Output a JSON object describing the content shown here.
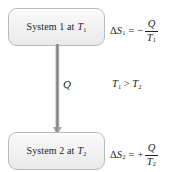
{
  "figure": {
    "type": "thermodynamics-heat-transfer-diagram",
    "background_color": "#ffffff",
    "text_color": "#231f20"
  },
  "top_box": {
    "name": "System 1",
    "prefix": "System 1 at ",
    "temperature_symbol": "T",
    "temperature_subscript": "1",
    "fill_color": "#f1f1f2",
    "border_color": "#b9babc"
  },
  "bottom_box": {
    "name": "System 2",
    "prefix": "System 2 at ",
    "temperature_symbol": "T",
    "temperature_subscript": "2",
    "fill_color": "#f1f1f2",
    "border_color": "#b9babc"
  },
  "arrow": {
    "label": "Q",
    "direction": "down",
    "meaning": "heat flow from system 1 to system 2",
    "color": "#8c8d8f"
  },
  "temperature_comparison": {
    "left_symbol": "T",
    "left_subscript": "1",
    "relation": ">",
    "right_symbol": "T",
    "right_subscript": "2"
  },
  "equations": [
    {
      "id": "entropy-change-system-1",
      "delta": "Δ",
      "quantity": "S",
      "quantity_subscript": "1",
      "equals": "=",
      "sign": "−",
      "numerator": "Q",
      "denominator": "T",
      "denominator_subscript": "1",
      "plain_text": "ΔS₁ = − Q/T₁"
    },
    {
      "id": "entropy-change-system-2",
      "delta": "Δ",
      "quantity": "S",
      "quantity_subscript": "2",
      "equals": "=",
      "sign": "+",
      "numerator": "Q",
      "denominator": "T",
      "denominator_subscript": "2",
      "plain_text": "ΔS₂ = + Q/T₂"
    }
  ]
}
